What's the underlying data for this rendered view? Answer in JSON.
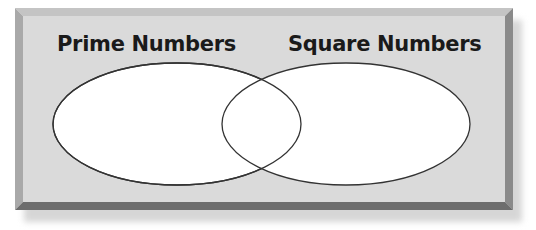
{
  "diagram": {
    "type": "venn",
    "sets": [
      {
        "label": "Prime Numbers",
        "cx": 177,
        "cy": 124,
        "rx": 124,
        "ry": 61
      },
      {
        "label": "Square Numbers",
        "cx": 346,
        "cy": 124,
        "rx": 124,
        "ry": 61
      }
    ],
    "colors": {
      "panel": "#d9d9d9",
      "bevel_light": "#bdbdbd",
      "bevel_dark": "#6f6f6f",
      "ellipse_fill": "#ffffff",
      "ellipse_stroke": "#333333"
    }
  }
}
